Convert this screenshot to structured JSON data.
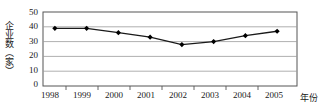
{
  "chart_data": {
    "type": "line",
    "title": "",
    "subtitle": "",
    "xlabel": "年份",
    "ylabel": "企业数（家）",
    "categories": [
      "1998",
      "1999",
      "2000",
      "2001",
      "2002",
      "2003",
      "2004",
      "2005"
    ],
    "values": [
      39,
      39,
      36,
      33,
      28,
      30,
      34,
      37
    ],
    "series": [
      {
        "name": "企业数",
        "values": [
          39,
          39,
          36,
          33,
          28,
          30,
          34,
          37
        ]
      }
    ],
    "ylim": [
      0,
      50
    ],
    "yticks": [
      0,
      10,
      20,
      30,
      40,
      50
    ],
    "ytick_labels": [
      "0",
      "10",
      "20",
      "30",
      "40",
      "50"
    ],
    "xtick_labels": [
      "1998",
      "1999",
      "2000",
      "2001",
      "2002",
      "2003",
      "2004",
      "2005"
    ],
    "grid": true,
    "grid_axis": "y",
    "legend": false,
    "legend_position": "none",
    "marker": "diamond",
    "line_color": "#1a1a1a",
    "marker_color": "#000000",
    "grid_color": "#9a9a9a",
    "axis_color": "#555555",
    "background": "#ffffff"
  }
}
